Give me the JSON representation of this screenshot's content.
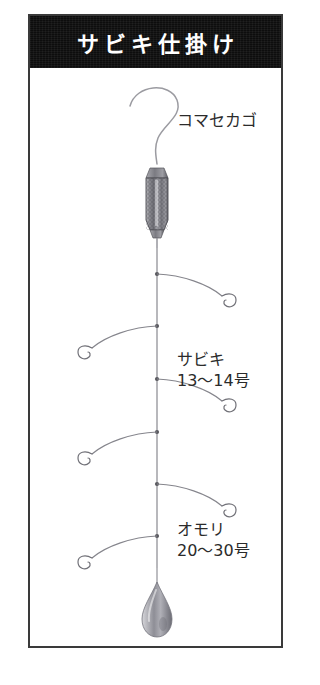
{
  "page": {
    "background_color": "#ffffff",
    "frame_border_color": "#3a3a3a"
  },
  "header": {
    "title": "サビキ仕掛け",
    "background_color": "#0d0d0d",
    "text_color": "#ffffff"
  },
  "diagram": {
    "name": "sabiki-rig-diagram",
    "main_line_color": "#8a8a90",
    "labels": {
      "cage": {
        "text": "コマセカゴ",
        "target": "chum-cage"
      },
      "sabiki": {
        "line1": "サビキ",
        "line2": "13〜14号",
        "target": "sabiki-hooks"
      },
      "sinker": {
        "line1": "オモリ",
        "line2": "20〜30号",
        "target": "lead-sinker"
      }
    },
    "components": [
      {
        "name": "top-line-loop",
        "label": ""
      },
      {
        "name": "chum-cage",
        "label": "コマセカゴ"
      },
      {
        "name": "sabiki-hooks",
        "label": "サビキ",
        "size": "13〜14号",
        "count": 6
      },
      {
        "name": "lead-sinker",
        "label": "オモリ",
        "size": "20〜30号"
      }
    ],
    "branches": [
      {
        "index": 1,
        "side": "right",
        "y": 206
      },
      {
        "index": 2,
        "side": "left",
        "y": 258
      },
      {
        "index": 3,
        "side": "right",
        "y": 311
      },
      {
        "index": 4,
        "side": "left",
        "y": 364
      },
      {
        "index": 5,
        "side": "right",
        "y": 416
      },
      {
        "index": 6,
        "side": "left",
        "y": 468
      }
    ]
  }
}
